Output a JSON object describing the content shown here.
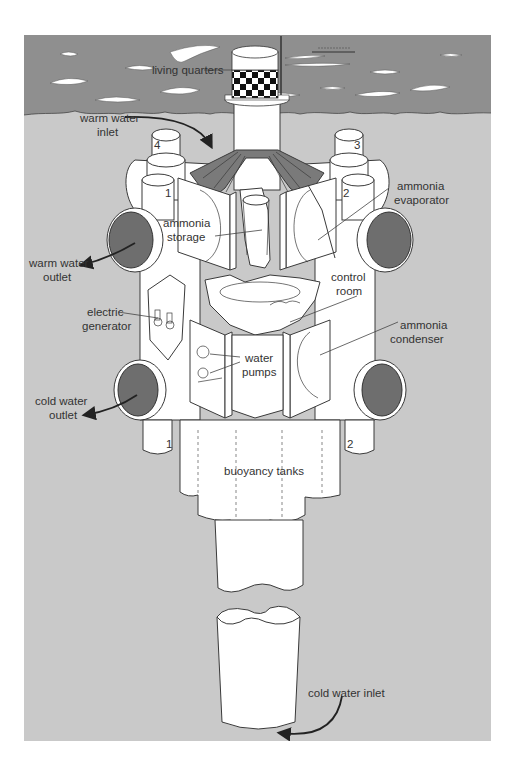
{
  "figure": {
    "colors": {
      "page_background": "#ffffff",
      "sea_surface": "#8f8f8f",
      "underwater": "#c9c9c9",
      "structure": "#ffffff",
      "pipe_opening": "#6e6e6e",
      "outline": "#3a3a3a"
    },
    "labels": {
      "living_quarters": "living quarters",
      "warm_water_inlet_line1": "warm water",
      "warm_water_inlet_line2": "inlet",
      "ammonia_storage_line1": "ammonia",
      "ammonia_storage_line2": "storage",
      "ammonia_evaporator_line1": "ammonia",
      "ammonia_evaporator_line2": "evaporator",
      "warm_water_outlet_line1": "warm water",
      "warm_water_outlet_line2": "outlet",
      "control_room_line1": "control",
      "control_room_line2": "room",
      "electric_generator_line1": "electric",
      "electric_generator_line2": "generator",
      "ammonia_condenser_line1": "ammonia",
      "ammonia_condenser_line2": "condenser",
      "water_pumps_line1": "water",
      "water_pumps_line2": "pumps",
      "cold_water_outlet_line1": "cold water",
      "cold_water_outlet_line2": "outlet",
      "buoyancy_tanks": "buoyancy tanks",
      "cold_water_inlet": "cold water inlet"
    },
    "module_numbers": {
      "top_left_back": "4",
      "top_right_back": "3",
      "top_left_front": "1",
      "top_right_front": "2",
      "bottom_left": "1",
      "bottom_right": "2"
    }
  }
}
